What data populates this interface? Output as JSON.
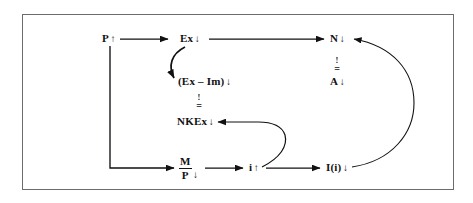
{
  "figure": {
    "kind": "economic-flow-diagram",
    "frame": {
      "border_color": "#6b6b70",
      "background": "#ffffff"
    },
    "ink_color": "#111114",
    "nodes": [
      {
        "id": "p",
        "label": "P",
        "arrow": "↑",
        "name": "node-price-level"
      },
      {
        "id": "ex",
        "label": "Ex",
        "arrow": "↓",
        "name": "node-exports"
      },
      {
        "id": "exim",
        "label": "(Ex – Im)",
        "arrow": "↓",
        "name": "node-net-exports"
      },
      {
        "id": "nkex",
        "label": "NKEx",
        "arrow": "↓",
        "name": "node-net-capital-exports"
      },
      {
        "id": "n",
        "label": "N",
        "arrow": "↓",
        "name": "node-employment"
      },
      {
        "id": "a",
        "label": "A",
        "arrow": "↓",
        "name": "node-aggregate-demand"
      },
      {
        "id": "i_rate",
        "label": "i",
        "arrow": "↑",
        "name": "node-interest-rate"
      },
      {
        "id": "invest",
        "label": "I(i)",
        "arrow": "↓",
        "name": "node-investment"
      }
    ],
    "fraction_node": {
      "id": "mp",
      "numerator": "M",
      "denominator": "P",
      "arrow": "↓",
      "name": "node-real-money-balances"
    },
    "identity_symbols": [
      {
        "id": "ident-left",
        "bang": "!",
        "equals": "=",
        "name": "identity-symbol-left"
      },
      {
        "id": "ident-right",
        "bang": "!",
        "equals": "=",
        "name": "identity-symbol-right"
      }
    ],
    "edges": [
      {
        "id": "p-to-ex",
        "from": "p",
        "to": "ex",
        "style": "straight",
        "name": "edge-p-to-ex"
      },
      {
        "id": "ex-to-n",
        "from": "ex",
        "to": "n",
        "style": "straight",
        "name": "edge-ex-to-n"
      },
      {
        "id": "ex-to-exim",
        "from": "ex",
        "to": "exim",
        "style": "curved",
        "name": "edge-ex-to-net-exports"
      },
      {
        "id": "p-to-mp",
        "from": "p",
        "to": "mp",
        "style": "elbow",
        "name": "edge-p-to-real-balances"
      },
      {
        "id": "mp-to-i",
        "from": "mp",
        "to": "i_rate",
        "style": "straight",
        "name": "edge-real-balances-to-i"
      },
      {
        "id": "i-to-invest",
        "from": "i_rate",
        "to": "invest",
        "style": "straight",
        "name": "edge-i-to-investment"
      },
      {
        "id": "i-to-nkex",
        "from": "i_rate",
        "to": "nkex",
        "style": "curved",
        "name": "edge-i-to-net-capital-exports"
      },
      {
        "id": "invest-to-n",
        "from": "invest",
        "to": "n",
        "style": "curved",
        "name": "edge-investment-to-n"
      }
    ]
  }
}
